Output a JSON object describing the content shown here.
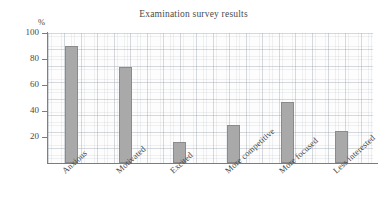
{
  "chart_data": {
    "type": "bar",
    "title": "Examination survey results",
    "xlabel": "",
    "ylabel": "%",
    "ylim": [
      0,
      100
    ],
    "yticks": [
      100,
      80,
      60,
      40,
      20
    ],
    "grid": true,
    "legend": "none",
    "categories": [
      "Anxious",
      "Motivated",
      "Excited",
      "More competitive",
      "More focused",
      "Less interested"
    ],
    "values": [
      90,
      74,
      16,
      29,
      47,
      25
    ],
    "bar_color": "#a9a9a9",
    "bar_border_color": "#8b8b8b"
  }
}
